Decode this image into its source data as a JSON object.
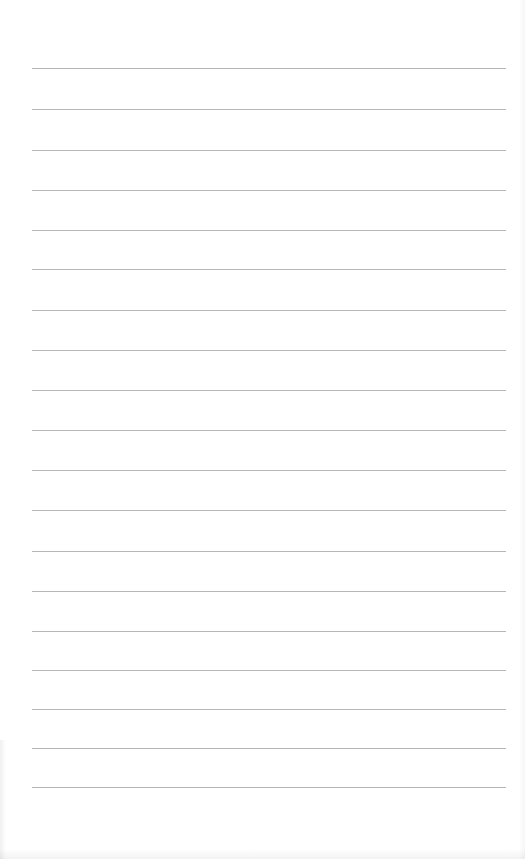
{
  "paper": {
    "type": "lined-notepaper",
    "background_color": "#ffffff",
    "line_color": "#a9a9a9",
    "line_count": 19,
    "line_left_px": 32,
    "line_right_px": 506,
    "line_positions_px": [
      68,
      109,
      150,
      190,
      230,
      269,
      310,
      350,
      390,
      430,
      470,
      510,
      551,
      591,
      631,
      670,
      709,
      748,
      787
    ],
    "text_lines": []
  }
}
